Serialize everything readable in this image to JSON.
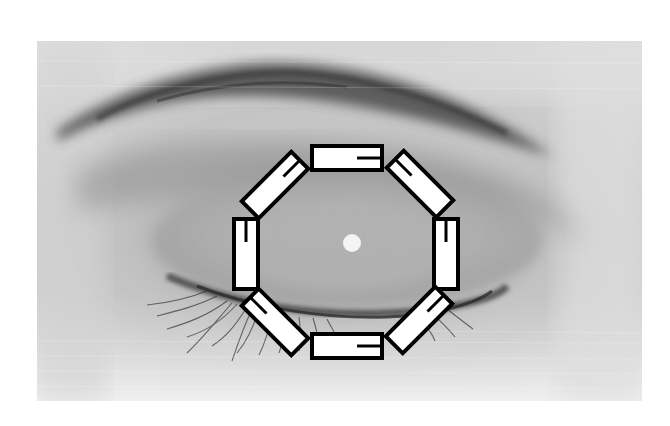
{
  "image": {
    "description": "Grayscale close-up photograph of a closed human eye with a ring of eight rectangular electrode markers arranged in an octagon around the eye",
    "background_color": "#ffffff",
    "photo_bounds": {
      "x": 37,
      "y": 41,
      "width": 605,
      "height": 360
    },
    "subject": "closed-eye",
    "colors": {
      "skin_light": "#e2e2e2",
      "skin_mid": "#b5b5b5",
      "eyebrow": "#3c3c3c",
      "lashes": "#2a2a2a",
      "electrode_fill": "#ffffff",
      "electrode_stroke": "#000000",
      "reflection": "#f2f2f2"
    }
  },
  "electrodes": {
    "count": 8,
    "arrangement": "octagon",
    "items": [
      {
        "position": "top",
        "cx": 347,
        "cy": 158,
        "rotation": 0
      },
      {
        "position": "top-right",
        "cx": 420,
        "cy": 184,
        "rotation": 45
      },
      {
        "position": "right",
        "cx": 446,
        "cy": 254,
        "rotation": 90
      },
      {
        "position": "bottom-right",
        "cx": 419,
        "cy": 320,
        "rotation": 135
      },
      {
        "position": "bottom",
        "cx": 347,
        "cy": 346,
        "rotation": 180
      },
      {
        "position": "bottom-left",
        "cx": 275,
        "cy": 322,
        "rotation": 225
      },
      {
        "position": "left",
        "cx": 246,
        "cy": 254,
        "rotation": 270
      },
      {
        "position": "top-left",
        "cx": 275,
        "cy": 185,
        "rotation": 315
      }
    ]
  },
  "reflection_dot": {
    "cx": 352,
    "cy": 243,
    "r": 9
  }
}
